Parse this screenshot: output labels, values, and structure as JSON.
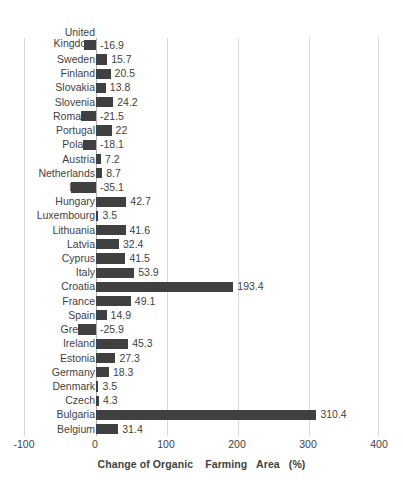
{
  "chart_data": {
    "type": "bar",
    "orientation": "horizontal",
    "title": "",
    "xlabel": "Change of Organic    Farming   Area   (%)",
    "ylabel": "",
    "xlim": [
      -100,
      400
    ],
    "xticks": [
      -100,
      0,
      100,
      200,
      300,
      400
    ],
    "xtick_labels": [
      "-100",
      "0",
      "100",
      "200",
      "300",
      "400"
    ],
    "grid": true,
    "grid_axis": "x",
    "legend": false,
    "bar_color": "#404040",
    "gridline_color": "#d9d9d9",
    "categories": [
      "United Kingdom",
      "Sweden",
      "Finland",
      "Slovakia",
      "Slovenia",
      "Romania",
      "Portugal",
      "Poland",
      "Austria",
      "Netherlands",
      "Malta",
      "Hungary",
      "Luxembourg",
      "Lithuania",
      "Latvia",
      "Cyprus",
      "Italy",
      "Croatia",
      "France",
      "Spain",
      "Greece",
      "Ireland",
      "Estonia",
      "Germany",
      "Denmark",
      "Czech",
      "Bulgaria",
      "Belgium"
    ],
    "values": [
      -16.9,
      15.7,
      20.5,
      13.8,
      24.2,
      -21.5,
      22,
      -18.1,
      7.2,
      8.7,
      -35.1,
      42.7,
      3.5,
      41.6,
      32.4,
      41.5,
      53.9,
      193.4,
      49.1,
      14.9,
      -25.9,
      45.3,
      27.3,
      18.3,
      3.5,
      4.3,
      310.4,
      31.4
    ],
    "value_labels": [
      "-16.9",
      "15.7",
      "20.5",
      "13.8",
      "24.2",
      "-21.5",
      "22",
      "-18.1",
      "7.2",
      "8.7",
      "-35.1",
      "42.7",
      "3.5",
      "41.6",
      "32.4",
      "41.5",
      "53.9",
      "193.4",
      "49.1",
      "14.9",
      "-25.9",
      "45.3",
      "27.3",
      "18.3",
      "3.5",
      "4.3",
      "310.4",
      "31.4"
    ]
  }
}
